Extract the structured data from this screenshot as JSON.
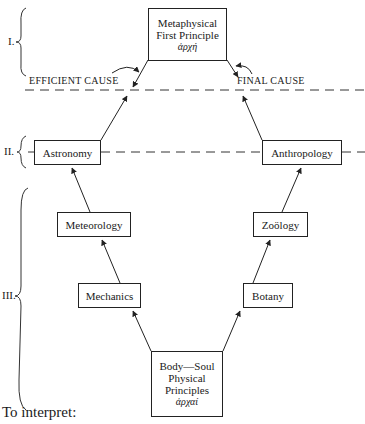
{
  "levels": {
    "I": "I.",
    "II": "II.",
    "III": "III."
  },
  "top_box": {
    "line1": "Metaphysical",
    "line2": "First Principle",
    "greek": "ἀρχή"
  },
  "causes": {
    "efficient": "EFFICIENT  CAUSE",
    "final": "FINAL  CAUSE"
  },
  "left_column": [
    {
      "label": "Astronomy"
    },
    {
      "label": "Meteorology"
    },
    {
      "label": "Mechanics"
    }
  ],
  "right_column": [
    {
      "label": "Anthropology"
    },
    {
      "label": "Zoölogy"
    },
    {
      "label": "Botany"
    }
  ],
  "bottom_box": {
    "line1": "Body—Soul",
    "line2": "Physical",
    "line3": "Principles",
    "greek": "ἀρχαί"
  },
  "footer": {
    "text": "To interpret:"
  }
}
